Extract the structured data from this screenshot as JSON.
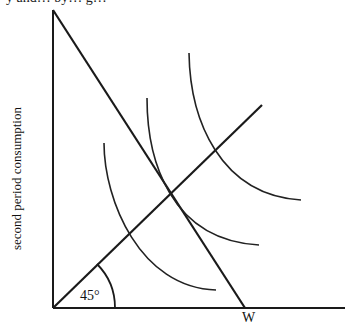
{
  "diagram": {
    "type": "consumption-smoothing indifference diagram",
    "cut_off_top_text": "y and… by… g…",
    "y_axis_label": "second period consumption",
    "x_axis_label": "",
    "angle_label": "45°",
    "budget_intercept_label": "W",
    "elements": {
      "axes": "first quadrant",
      "budget_line": "from top of y-axis to W on x-axis",
      "ray_45": "from origin at 45 degrees",
      "indifference_curves": 3,
      "tangent_curve_index": 2
    },
    "colors": {
      "ink": "#1a1a1a",
      "background": "#ffffff"
    }
  }
}
